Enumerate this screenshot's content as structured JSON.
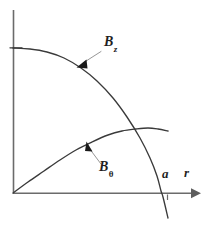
{
  "figure": {
    "kind": "line-plot-diagram",
    "background_color": "#ffffff",
    "width": 209,
    "height": 228
  },
  "axes": {
    "x_axis": {
      "label": "r",
      "origin_px": [
        13,
        193
      ],
      "end_px": [
        200,
        193
      ],
      "has_arrowhead": true,
      "color": "#6b6b6b"
    },
    "y_axis": {
      "label": "",
      "top_px": [
        13,
        10
      ],
      "bottom_px": [
        13,
        193
      ],
      "has_arrowhead": false,
      "color": "#6b6b6b"
    },
    "ticks": [
      {
        "name": "radius-a",
        "label": "a",
        "x_px": 167,
        "side": "below-axis"
      }
    ]
  },
  "labels": {
    "bz": {
      "base": "B",
      "sub": "z",
      "sub_style": "italic"
    },
    "btheta": {
      "base": "B",
      "sub": "θ",
      "sub_style": "upright"
    },
    "a": {
      "base": "a"
    },
    "r": {
      "base": "r"
    }
  },
  "chart_data": {
    "type": "line",
    "title": "",
    "subtitle": "",
    "xlabel": "r",
    "ylabel": "",
    "xlim": [
      0,
      1
    ],
    "ylim": [
      -0.35,
      1.1
    ],
    "grid": false,
    "legend": "inline-annotations",
    "annotations": [
      {
        "text": "B_z",
        "target_curve": "B_z",
        "label_px": [
          112,
          42
        ],
        "arrow_tip_px": [
          77,
          67
        ],
        "arrow_tail_px": [
          101,
          51
        ]
      },
      {
        "text": "B_θ",
        "target_curve": "B_theta",
        "label_px": [
          108,
          167
        ],
        "arrow_tip_px": [
          87,
          142
        ],
        "arrow_tail_px": [
          101,
          163
        ]
      }
    ],
    "series": [
      {
        "name": "B_z",
        "label": "B_z",
        "color": "#3a3a3a",
        "description": "axial field: flat at the axis, decreasing monotonically, crossing zero just inside r = a and continuing negative",
        "points_px": [
          [
            13,
            48
          ],
          [
            30,
            49
          ],
          [
            47,
            52
          ],
          [
            64,
            58
          ],
          [
            81,
            68
          ],
          [
            97,
            81
          ],
          [
            113,
            98
          ],
          [
            127,
            117
          ],
          [
            140,
            138
          ],
          [
            150,
            158
          ],
          [
            157,
            176
          ],
          [
            161,
            191
          ],
          [
            163,
            197
          ],
          [
            168,
            218
          ]
        ],
        "x_values": [
          0.0,
          0.09,
          0.18,
          0.27,
          0.36,
          0.45,
          0.53,
          0.61,
          0.68,
          0.73,
          0.77,
          0.79,
          0.8,
          0.83
        ],
        "y_values": [
          0.79,
          0.78,
          0.76,
          0.73,
          0.68,
          0.61,
          0.52,
          0.41,
          0.3,
          0.19,
          0.09,
          0.01,
          -0.02,
          -0.14
        ]
      },
      {
        "name": "B_theta",
        "label": "B_θ",
        "color": "#3a3a3a",
        "description": "azimuthal field: zero at the axis, rising with decreasing slope to a maximum near r = a, then turning over slightly",
        "points_px": [
          [
            13,
            193
          ],
          [
            28,
            182
          ],
          [
            44,
            171
          ],
          [
            60,
            160
          ],
          [
            76,
            150
          ],
          [
            92,
            142
          ],
          [
            108,
            135
          ],
          [
            122,
            131
          ],
          [
            136,
            129
          ],
          [
            148,
            128
          ],
          [
            158,
            129
          ],
          [
            168,
            131
          ]
        ],
        "x_values": [
          0.0,
          0.08,
          0.17,
          0.25,
          0.34,
          0.42,
          0.51,
          0.58,
          0.66,
          0.72,
          0.78,
          0.83
        ],
        "y_values": [
          0.0,
          0.06,
          0.12,
          0.18,
          0.23,
          0.28,
          0.31,
          0.34,
          0.35,
          0.35,
          0.35,
          0.34
        ]
      }
    ]
  }
}
